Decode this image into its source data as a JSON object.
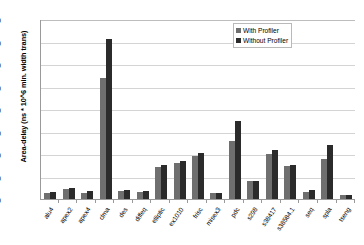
{
  "chart_data": {
    "type": "bar",
    "title": "",
    "xlabel": "",
    "ylabel": "Area-delay (ns * 10^6 min. width trans)",
    "ylim": [
      0,
      4000
    ],
    "ytick_step": 500,
    "yticks": [
      0,
      500,
      1000,
      1500,
      2000,
      2500,
      3000,
      3500,
      4000
    ],
    "ytick_labels": [
      "0",
      "500",
      "1000",
      "1500",
      "2000",
      "2500",
      "3000",
      "3500",
      "4000"
    ],
    "grid": true,
    "grid_axis": "y",
    "legend_position": "top-right",
    "categories": [
      "alu4",
      "apex2",
      "apex4",
      "clma",
      "des",
      "diffeq",
      "elliptic",
      "ex1010",
      "frisc",
      "misex3",
      "pdc",
      "s298",
      "s38417",
      "s38584.1",
      "seq",
      "spla",
      "tseng"
    ],
    "series": [
      {
        "name": "With Profiler",
        "color": "#6f6f6f",
        "values": [
          140,
          230,
          140,
          2700,
          185,
          155,
          720,
          790,
          960,
          130,
          1280,
          400,
          1000,
          730,
          165,
          880,
          90
        ]
      },
      {
        "name": "Without Profiler",
        "color": "#2b2b2b",
        "values": [
          155,
          255,
          175,
          3550,
          195,
          170,
          760,
          840,
          1020,
          135,
          1740,
          405,
          1090,
          755,
          190,
          1190,
          95
        ]
      }
    ]
  },
  "colors": {
    "with_profiler": "#6f6f6f",
    "without_profiler": "#2b2b2b",
    "gridline": "#d4d4d4",
    "axis": "#9a9a9a",
    "background": "#ffffff"
  }
}
